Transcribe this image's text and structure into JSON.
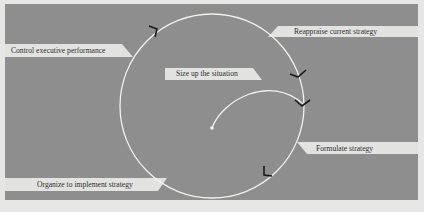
{
  "diagram": {
    "type": "strategic-management-cycle",
    "colors": {
      "background": "#e6e6e4",
      "panel": "#8e8e8e",
      "tab": "#e2e2e0",
      "curve": "#f2f2f0",
      "arrow": "#1a1a1a",
      "text": "#2e2e2e"
    },
    "start": {
      "label": "Size up the situation"
    },
    "stages": [
      {
        "label": "Reappraise current strategy"
      },
      {
        "label": "Formulate strategy"
      },
      {
        "label": "Organize to implement strategy"
      },
      {
        "label": "Control executive performance"
      }
    ]
  }
}
